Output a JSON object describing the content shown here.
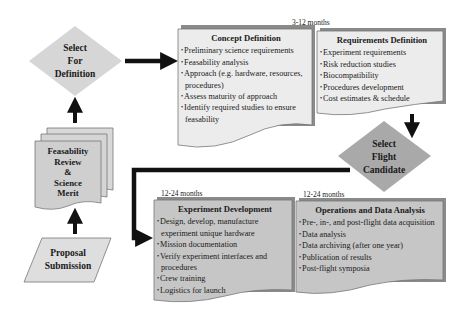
{
  "diagram": {
    "nodes": {
      "select_for_definition": {
        "label_lines": [
          "Select",
          "For",
          "Definition"
        ],
        "shape": "diamond",
        "fill": "#d6d6d6"
      },
      "feasibility_review": {
        "label_lines": [
          "Feasability",
          "Review",
          "&",
          "Science",
          "Merit"
        ],
        "shape": "multi-document",
        "fill": "#d2d2d2"
      },
      "proposal_submission": {
        "label_lines": [
          "Proposal",
          "Submission"
        ],
        "shape": "parallelogram",
        "fill": "#dedede"
      },
      "select_flight_candidate": {
        "label_lines": [
          "Select",
          "Flight",
          "Candidate"
        ],
        "shape": "diamond",
        "fill": "#a9a9a9"
      }
    },
    "phases": {
      "concept_definition": {
        "title": "Concept Definition",
        "items": [
          "Preliminary science requirements",
          "Feasability analysis",
          "Approach (e.g. hardware, resources, procedures)",
          "Assess maturity of approach",
          "Identify required studies to ensure feasability"
        ]
      },
      "requirements_definition": {
        "title": "Requirements Definition",
        "items": [
          "Experiment requirements",
          "Risk reduction studies",
          "Biocompatibility",
          "Procedures development",
          "Cost estimates & schedule"
        ]
      },
      "experiment_development": {
        "title": "Experiment Development",
        "duration": "12-24 months",
        "items": [
          "Design, develop, manufacture experiment unique hardware",
          "Mission documentation",
          "Verify experiment interfaces and procedures",
          "Crew training",
          "Logistics for launch"
        ]
      },
      "operations_data_analysis": {
        "title": "Operations and Data Analysis",
        "duration": "12-24 months",
        "items": [
          "Pre-, in-, and post-flight data acquisition",
          "Data analysis",
          "Data archiving (after one year)",
          "Publication of results",
          "Post-flight symposia"
        ]
      }
    },
    "definition_duration": "3-12 months",
    "flow": [
      "Proposal Submission",
      "Feasability Review & Science Merit",
      "Select For Definition",
      "Concept Definition",
      "Requirements Definition",
      "Select Flight Candidate",
      "Experiment Development",
      "Operations and Data Analysis"
    ],
    "colors": {
      "light_box": "#e9e9e9",
      "dark_box": "#c6c6c6",
      "shadow": "#8a8a8a",
      "arrow": "#111111"
    }
  }
}
